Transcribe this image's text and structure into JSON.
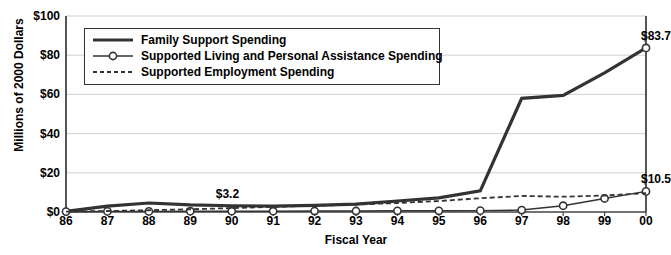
{
  "chart_data": {
    "type": "line",
    "title": "",
    "xlabel": "Fiscal Year",
    "ylabel": "Millions of 2000 Dollars",
    "categories": [
      "86",
      "87",
      "88",
      "89",
      "90",
      "91",
      "92",
      "93",
      "94",
      "95",
      "96",
      "97",
      "98",
      "99",
      "00"
    ],
    "ylim": [
      0,
      100
    ],
    "ytick_values": [
      0,
      20,
      40,
      60,
      80,
      100
    ],
    "ytick_labels": [
      "$0",
      "$20",
      "$40",
      "$60",
      "$80",
      "$100"
    ],
    "grid": "horizontal",
    "legend_position": "upper-left-inside",
    "series": [
      {
        "name": "Family Support Spending",
        "style": "solid-thick",
        "marker": "none",
        "color": "#333333",
        "values": [
          0.3,
          3.0,
          4.6,
          3.6,
          3.2,
          3.0,
          3.4,
          4.0,
          5.6,
          7.2,
          10.8,
          58.0,
          59.5,
          71.0,
          83.7
        ]
      },
      {
        "name": "Supported Living and Personal Assistance Spending",
        "style": "solid-thin",
        "marker": "circle",
        "color": "#333333",
        "values": [
          0.2,
          0.3,
          0.3,
          0.4,
          0.4,
          0.4,
          0.5,
          0.5,
          0.6,
          0.6,
          0.7,
          1.0,
          3.2,
          6.9,
          10.5
        ]
      },
      {
        "name": "Supported Employment Spending",
        "style": "dashed",
        "marker": "none",
        "color": "#333333",
        "values": [
          0.2,
          0.5,
          0.9,
          1.4,
          2.0,
          2.6,
          3.2,
          3.8,
          4.6,
          5.6,
          7.0,
          8.2,
          7.8,
          8.4,
          9.6
        ]
      }
    ],
    "annotations": [
      {
        "text": "$3.2",
        "category": "90",
        "series": "Supported Living and Personal Assistance Spending",
        "value": 3.2
      },
      {
        "text": "$83.7",
        "category": "00",
        "series": "Family Support Spending",
        "value": 83.7
      },
      {
        "text": "$10.5",
        "category": "00",
        "series": "Supported Living and Personal Assistance Spending",
        "value": 10.5
      }
    ]
  },
  "colors": {
    "line": "#333333",
    "grid": "#d0d0d0",
    "axis": "#444444",
    "background": "#ffffff"
  }
}
